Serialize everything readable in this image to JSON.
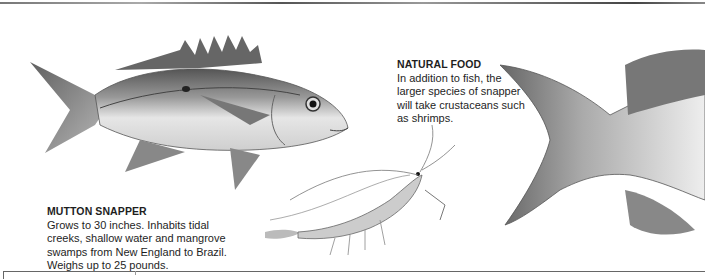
{
  "captions": {
    "mutton_snapper": {
      "title": "MUTTON SNAPPER",
      "body": "Grows to 30 inches. Inhabits tidal creeks, shallow water and mangrove swamps from New England to Brazil. Weighs up to 25 pounds."
    },
    "natural_food": {
      "title": "NATURAL FOOD",
      "body": "In addition to fish, the larger species of snapper will take crustaceans such as shrimps."
    }
  },
  "illustrations": {
    "snapper": "mutton-snapper-fish",
    "shrimp": "shrimp",
    "tail_detail": "snapper-tail-closeup"
  },
  "colors": {
    "text": "#1e1e1e",
    "background": "#ffffff",
    "rule": "#666666"
  }
}
